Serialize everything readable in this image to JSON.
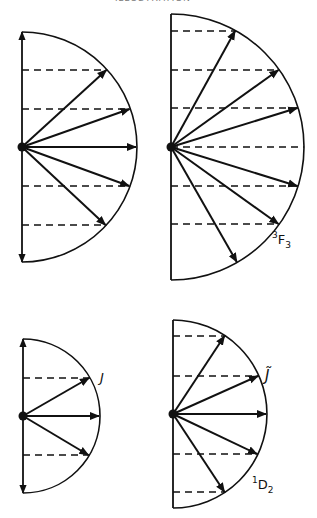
{
  "header": {
    "text": "ILLUSTRATION"
  },
  "diagrams": [
    {
      "id": "top-left",
      "cx": 22,
      "cy": 147,
      "r": 115,
      "dashed_y": [
        70,
        109,
        186,
        225
      ],
      "arrow_levels": [
        70,
        109,
        147,
        186,
        225
      ],
      "axis_arrows": true,
      "label": null
    },
    {
      "id": "top-right",
      "cx": 171,
      "cy": 147,
      "r": 133,
      "dashed_y": [
        31,
        70,
        108,
        147,
        186,
        224
      ],
      "arrow_levels": [
        31,
        70,
        108,
        186,
        224,
        262
      ],
      "axis_arrows": false,
      "label": {
        "main": "F",
        "sup": "3",
        "sub": "3"
      }
    },
    {
      "id": "bottom-left",
      "cx": 23,
      "cy": 416,
      "r": 77,
      "dashed_y": [
        378,
        455
      ],
      "arrow_levels": [
        378,
        416,
        455
      ],
      "axis_arrows": true,
      "label": {
        "main": "J"
      }
    },
    {
      "id": "bottom-right",
      "cx": 173,
      "cy": 414,
      "r": 94,
      "dashed_y": [
        336,
        376,
        454,
        492
      ],
      "arrow_levels": [
        336,
        376,
        414,
        454,
        492
      ],
      "axis_arrows": false,
      "label": {
        "main": "J̃",
        "term": {
          "main": "D",
          "sup": "1",
          "sub": "2"
        }
      }
    }
  ],
  "labels": {
    "term_3F3": {
      "sup": "3",
      "main": "F",
      "sub": "3"
    },
    "J": "J",
    "J_tilde": "J̃",
    "term_1D2": {
      "sup": "1",
      "main": "D",
      "sub": "2"
    }
  }
}
